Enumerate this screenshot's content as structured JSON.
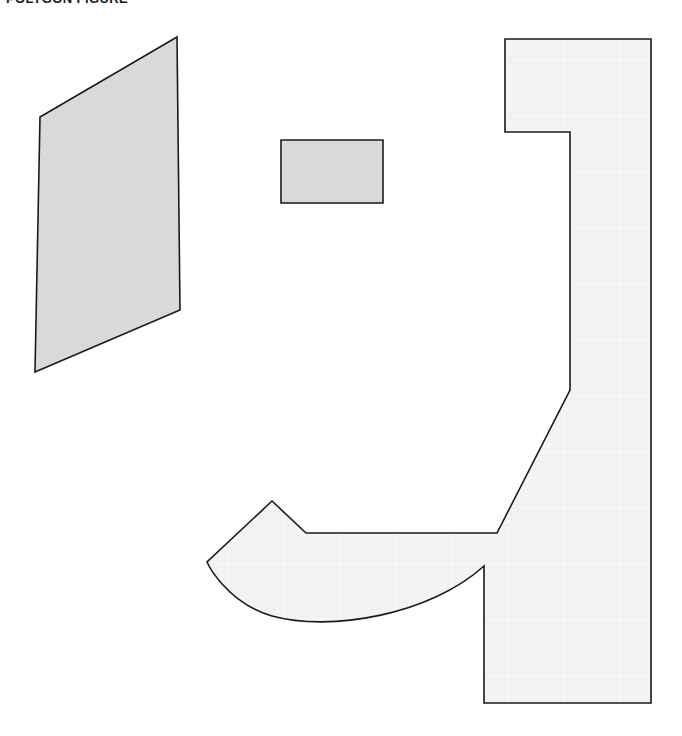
{
  "figure": {
    "title": "POLYGON FIGURE",
    "background_color": "#ffffff",
    "width": 682,
    "height": 736,
    "shapes": [
      {
        "name": "skewed-quadrilateral",
        "label": "Shape 1",
        "fill": "#d9d9d9",
        "stroke": "#1a1a1a",
        "stroke_width": 1.6,
        "points": "177,37 40,117 35,372 180,310"
      },
      {
        "name": "small-rectangle",
        "label": "Shape 2",
        "fill": "#d9d9d9",
        "stroke": "#1a1a1a",
        "stroke_width": 1.6,
        "points": "281,140 383,140 383,203 281,203"
      },
      {
        "name": "hook-polygon",
        "label": "Shape 3",
        "fill": "#f2f2f2",
        "stroke": "#1a1a1a",
        "stroke_width": 1.6,
        "outline_path": "M 505,39 L 651,39 L 651,703 L 484,703 L 484,566 C 430,615 330,632 272,616 C 225,602 207,562 207,562 L 272,501 L 306,533 L 497,533 L 570,390 L 570,132 L 505,132 Z"
      }
    ]
  }
}
